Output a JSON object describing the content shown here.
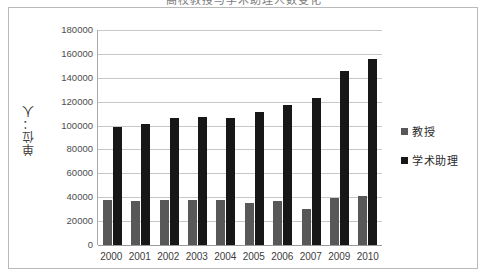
{
  "title": "高校教授与学术助理人数变化",
  "chart_data": {
    "type": "bar",
    "title": "高校教授与学术助理人数变化",
    "xlabel": "",
    "ylabel": "单位：人",
    "categories": [
      "2000",
      "2001",
      "2002",
      "2003",
      "2004",
      "2005",
      "2006",
      "2007",
      "2009",
      "2010"
    ],
    "series": [
      {
        "name": "教授",
        "color": "#585858",
        "values": [
          37500,
          37000,
          37500,
          37500,
          37500,
          35000,
          37000,
          30500,
          39500,
          41000
        ]
      },
      {
        "name": "学术助理",
        "color": "#171717",
        "values": [
          98500,
          101500,
          106000,
          107500,
          106500,
          111000,
          117000,
          123000,
          146000,
          156000
        ]
      }
    ],
    "ylim": [
      0,
      180000
    ],
    "ytick_step": 20000,
    "yticks": [
      0,
      20000,
      40000,
      60000,
      80000,
      100000,
      120000,
      140000,
      160000,
      180000
    ],
    "ytick_labels": [
      "0",
      "20000",
      "40000",
      "60000",
      "80000",
      "100000",
      "120000",
      "140000",
      "160000",
      "180000"
    ],
    "grid": true,
    "legend_position": "right"
  },
  "legend": {
    "items": [
      {
        "label": "教授",
        "color": "#585858"
      },
      {
        "label": "学术助理",
        "color": "#171717"
      }
    ]
  }
}
